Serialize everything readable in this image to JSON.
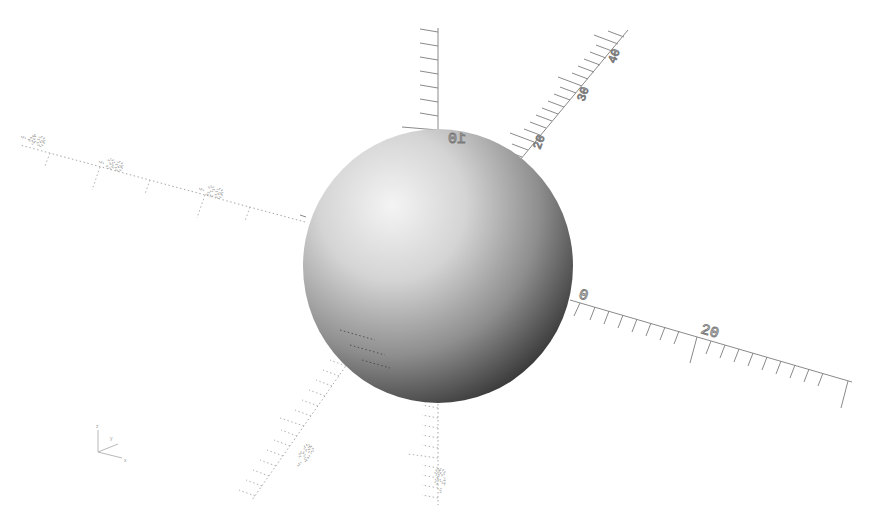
{
  "app": "OpenSCAD",
  "viewport": {
    "background": "#ffffff",
    "object": {
      "type": "sphere",
      "shading_light": "#f2f2f2",
      "shading_dark": "#3c3c3c"
    },
    "axes": {
      "x": {
        "positive_labels": [
          "0",
          "20"
        ],
        "negative_labels": [
          "-20",
          "-30",
          "-40"
        ]
      },
      "y": {
        "positive_labels": [
          "20",
          "30",
          "40"
        ],
        "negative_labels": [
          "-20"
        ]
      },
      "z": {
        "positive_labels": [
          "10"
        ],
        "negative_labels": [
          "-20"
        ]
      }
    },
    "axis_indicator": {
      "labels": [
        "z",
        "y",
        "x"
      ]
    }
  },
  "labels": {
    "x_neg40": "-40",
    "x_neg30": "-30",
    "x_neg20": "-20",
    "x_0": "0",
    "x_20": "20",
    "y_20": "20",
    "y_30": "30",
    "y_40": "40",
    "y_neg20": "-20",
    "z_10": "10",
    "z_neg20": "-20",
    "ind_z": "z",
    "ind_y": "y",
    "ind_x": "x"
  }
}
